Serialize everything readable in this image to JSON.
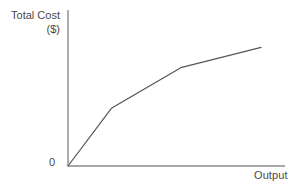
{
  "chart_data": {
    "type": "line",
    "title": "",
    "subtitle": "",
    "xlabel": "Output",
    "ylabel": "Total Cost ($)",
    "ylabel_line1": "Total Cost",
    "ylabel_line2": "($)",
    "origin_tick_label": "0",
    "grid": false,
    "legend": false,
    "axis_color": "#8a8a8a",
    "line_color": "#555555",
    "text_color": "#4a4a4a",
    "background_color": "#ffffff",
    "xlim": [
      0,
      100
    ],
    "ylim": [
      0,
      100
    ],
    "x_tick_labels": [],
    "y_tick_labels": [],
    "series": [
      {
        "name": "Total Cost",
        "x": [
          0,
          20,
          52,
          89
        ],
        "y": [
          0,
          37,
          63,
          76
        ]
      }
    ],
    "annotations": []
  }
}
